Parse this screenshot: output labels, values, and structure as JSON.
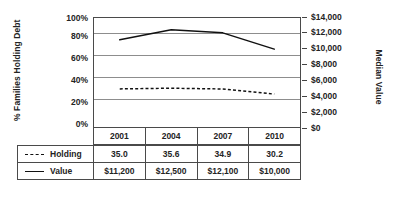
{
  "chart_data": {
    "type": "line",
    "title": "",
    "categories": [
      "2001",
      "2004",
      "2007",
      "2010"
    ],
    "xlabel": "",
    "grid": true,
    "legend_position": "table-left",
    "axes": {
      "left": {
        "label": "% Families Holding Debt",
        "ticks": [
          "0%",
          "20%",
          "40%",
          "60%",
          "80%",
          "100%"
        ],
        "min": 0,
        "max": 100
      },
      "right": {
        "label": "Median Value",
        "ticks": [
          "$0",
          "$2,000",
          "$4,000",
          "$6,000",
          "$8,000",
          "$10,000",
          "$12,000",
          "$14,000"
        ],
        "min": 0,
        "max": 14000
      }
    },
    "series": [
      {
        "name": "Holding",
        "axis": "left",
        "style": "dashed",
        "values": [
          35.0,
          35.6,
          34.9,
          30.2
        ],
        "display_values": [
          "35.0",
          "35.6",
          "34.9",
          "30.2"
        ]
      },
      {
        "name": "Value",
        "axis": "right",
        "style": "solid",
        "values": [
          11200,
          12500,
          12100,
          10000
        ],
        "display_values": [
          "$11,200",
          "$12,500",
          "$12,100",
          "$10,000"
        ]
      }
    ]
  },
  "table": {
    "year_header": [
      "2001",
      "2004",
      "2007",
      "2010"
    ],
    "rows": [
      {
        "label": "Holding",
        "swatch": "dashed-line-swatch",
        "cells": [
          "35.0",
          "35.6",
          "34.9",
          "30.2"
        ]
      },
      {
        "label": "Value",
        "swatch": "solid-line-swatch",
        "cells": [
          "$11,200",
          "$12,500",
          "$12,100",
          "$10,000"
        ]
      }
    ]
  },
  "colors": {
    "series_line": "#111111",
    "gridline": "#8d8d8d",
    "border": "#4a4a4a",
    "text": "#232323",
    "background": "#ffffff"
  }
}
